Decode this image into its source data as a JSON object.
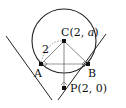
{
  "diagram": {
    "type": "geometry",
    "points": {
      "C": {
        "label": "C(2, ",
        "var": "a",
        "close": ")"
      },
      "A": {
        "label": "A"
      },
      "B": {
        "label": "B"
      },
      "P": {
        "label": "P(2, 0)"
      }
    },
    "radius_label": "2",
    "colors": {
      "stroke": "#222222",
      "thin": "#666666",
      "background": "#ffffff"
    }
  }
}
